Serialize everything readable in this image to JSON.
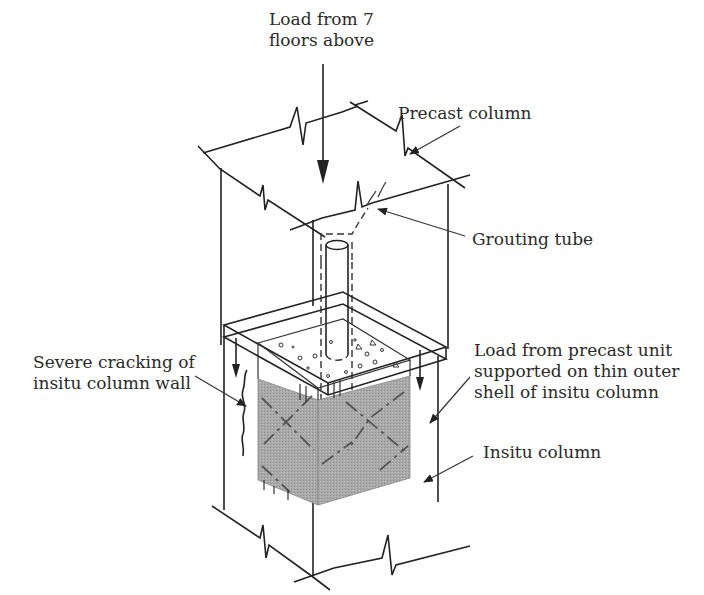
{
  "diagram": {
    "type": "isometric-structural-detail",
    "labels": {
      "load_above": [
        "Load from 7",
        "floors above"
      ],
      "precast_column": "Precast column",
      "grouting_tube": "Grouting tube",
      "cracking": [
        "Severe cracking of",
        "insitu column wall"
      ],
      "load_shell": [
        "Load from precast unit",
        "supported on thin outer",
        "shell of insitu column"
      ],
      "insitu_column": "Insitu column"
    },
    "colors": {
      "line": "#222222",
      "core_fill": "#a8a8a8",
      "core_fill_dark": "#9a9a9a",
      "background": "#ffffff"
    }
  }
}
